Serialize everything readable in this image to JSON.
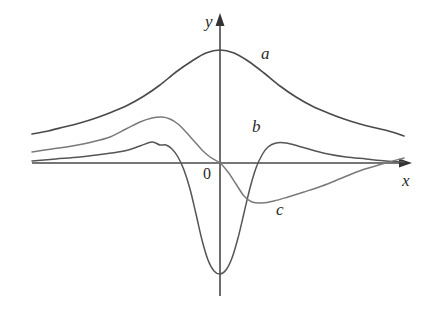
{
  "figure": {
    "background_color": "#ffffff",
    "axis_color": "#4a4a4a",
    "labels": {
      "x_axis": "x",
      "y_axis": "y",
      "origin": "0",
      "curve_a": "a",
      "curve_b": "b",
      "curve_c": "c"
    }
  },
  "chart_data": {
    "type": "line",
    "title": "",
    "subtitle": "",
    "xlabel": "x",
    "ylabel": "y",
    "grid": false,
    "legend": "inline-curve-labels",
    "xlim": [
      -4.7,
      5.0
    ],
    "ylim": [
      -2.9,
      1.65
    ],
    "axes": {
      "origin_px": [
        220,
        163
      ],
      "x_axis_px": {
        "x_start": 32,
        "x_end": 412,
        "y": 163,
        "arrow": "right"
      },
      "y_axis_px": {
        "y_start": 13,
        "y_end": 296,
        "x": 220,
        "arrow": "up"
      },
      "x_unit_px": 40,
      "y_unit_px": 45
    },
    "annotations": [
      {
        "text": "a",
        "x_px": 261,
        "y_px": 45
      },
      {
        "text": "b",
        "x_px": 252,
        "y_px": 118
      },
      {
        "text": "c",
        "x_px": 276,
        "y_px": 201
      },
      {
        "text": "x",
        "x_px": 402,
        "y_px": 172
      },
      {
        "text": "y",
        "x_px": 205,
        "y_px": 13
      },
      {
        "text": "0",
        "x_px": 203,
        "y_px": 166
      }
    ],
    "series": [
      {
        "name": "a",
        "label": "a",
        "color": "#4a4a4a",
        "width": 1.6,
        "description": "bell-shaped curve, single maximum on the y-axis, decaying tails both sides",
        "points_px": [
          [
            32,
            134
          ],
          [
            48,
            131
          ],
          [
            64,
            127
          ],
          [
            80,
            123
          ],
          [
            96,
            118
          ],
          [
            112,
            112
          ],
          [
            128,
            105
          ],
          [
            144,
            96
          ],
          [
            160,
            85
          ],
          [
            176,
            72
          ],
          [
            192,
            61
          ],
          [
            206,
            53
          ],
          [
            220,
            50
          ],
          [
            234,
            53
          ],
          [
            248,
            61
          ],
          [
            264,
            73
          ],
          [
            280,
            86
          ],
          [
            296,
            97
          ],
          [
            312,
            106
          ],
          [
            328,
            113
          ],
          [
            344,
            119
          ],
          [
            360,
            124
          ],
          [
            376,
            128
          ],
          [
            392,
            132
          ],
          [
            404,
            136
          ]
        ]
      },
      {
        "name": "b",
        "label": "b",
        "color": "#555555",
        "width": 1.5,
        "description": "curve with a tall positive hump left of the y-axis, a deep negative minimum just right of the y-axis, a smaller positive hump to the right, then decaying to zero",
        "points_px": [
          [
            32,
            161
          ],
          [
            56,
            159
          ],
          [
            80,
            157
          ],
          [
            104,
            154
          ],
          [
            124,
            151
          ],
          [
            140,
            146
          ],
          [
            152,
            142
          ],
          [
            160,
            145
          ],
          [
            166,
            145
          ],
          [
            172,
            149
          ],
          [
            178,
            157
          ],
          [
            184,
            170
          ],
          [
            190,
            189
          ],
          [
            196,
            214
          ],
          [
            202,
            240
          ],
          [
            208,
            260
          ],
          [
            214,
            271
          ],
          [
            220,
            274
          ],
          [
            226,
            270
          ],
          [
            232,
            258
          ],
          [
            238,
            238
          ],
          [
            244,
            213
          ],
          [
            250,
            188
          ],
          [
            256,
            168
          ],
          [
            262,
            155
          ],
          [
            268,
            147
          ],
          [
            276,
            143
          ],
          [
            286,
            143
          ],
          [
            298,
            146
          ],
          [
            312,
            150
          ],
          [
            328,
            154
          ],
          [
            346,
            157
          ],
          [
            366,
            159
          ],
          [
            386,
            161
          ],
          [
            404,
            162
          ]
        ]
      },
      {
        "name": "c",
        "label": "c",
        "color": "#7a7a7a",
        "width": 1.5,
        "description": "curve with a positive maximum left of the y-axis, crossing zero at the origin, a negative minimum to the right, then rising slowly back toward zero",
        "points_px": [
          [
            32,
            152
          ],
          [
            52,
            149
          ],
          [
            72,
            146
          ],
          [
            92,
            142
          ],
          [
            110,
            137
          ],
          [
            126,
            129
          ],
          [
            140,
            122
          ],
          [
            152,
            118
          ],
          [
            162,
            117
          ],
          [
            170,
            119
          ],
          [
            178,
            124
          ],
          [
            186,
            132
          ],
          [
            194,
            141
          ],
          [
            202,
            150
          ],
          [
            210,
            157
          ],
          [
            220,
            163
          ],
          [
            228,
            172
          ],
          [
            236,
            184
          ],
          [
            244,
            196
          ],
          [
            252,
            202
          ],
          [
            262,
            203
          ],
          [
            274,
            201
          ],
          [
            288,
            197
          ],
          [
            304,
            192
          ],
          [
            322,
            186
          ],
          [
            342,
            178
          ],
          [
            362,
            170
          ],
          [
            382,
            164
          ],
          [
            404,
            158
          ]
        ]
      }
    ]
  }
}
